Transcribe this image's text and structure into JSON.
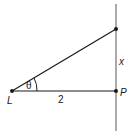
{
  "diagram": {
    "points": {
      "L": {
        "label": "L",
        "x": 12,
        "y": 91
      },
      "P": {
        "label": "P",
        "x": 116,
        "y": 91
      },
      "top": {
        "label": "",
        "x": 116,
        "y": 29
      }
    },
    "labels": {
      "angle": "θ",
      "base_length": "2",
      "vertical_length": "x",
      "point_L": "L",
      "point_P": "P"
    },
    "colors": {
      "stroke": "#1a1a1a",
      "background": "#ffffff"
    }
  }
}
